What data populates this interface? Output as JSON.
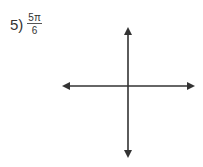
{
  "problem": {
    "number_label": "5)",
    "angle": {
      "numerator": "5π",
      "denominator": "6"
    }
  },
  "axes": {
    "origin": [
      128,
      86
    ],
    "horizontal": {
      "x_start": 62,
      "x_end": 195,
      "y": 86
    },
    "vertical": {
      "y_start": 27,
      "y_end": 158,
      "x": 128
    },
    "color": "#333333"
  }
}
